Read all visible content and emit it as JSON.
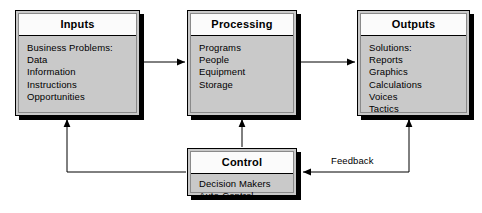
{
  "diagram": {
    "colors": {
      "box_fill": "#c9c9c9",
      "title_fill": "#fbfbfb",
      "border": "#000000",
      "shadow": "#000000",
      "line": "#000000"
    },
    "nodes": {
      "inputs": {
        "title": "Inputs",
        "items": [
          "Business Problems:",
          "Data",
          "Information",
          "Instructions",
          "Opportunities"
        ]
      },
      "processing": {
        "title": "Processing",
        "items": [
          "Programs",
          "People",
          "Equipment",
          "Storage"
        ]
      },
      "outputs": {
        "title": "Outputs",
        "items": [
          "Solutions:",
          "Reports",
          "Graphics",
          "Calculations",
          "Voices",
          "Tactics"
        ]
      },
      "control": {
        "title": "Control",
        "items": [
          "Decision Makers",
          "Auto-Control"
        ]
      }
    },
    "connectors": {
      "inputs_to_processing": {
        "label": ""
      },
      "processing_to_outputs": {
        "label": ""
      },
      "control_to_processing": {
        "label": ""
      },
      "control_to_inputs": {
        "label": ""
      },
      "outputs_to_control": {
        "label": "Feedback"
      }
    }
  }
}
